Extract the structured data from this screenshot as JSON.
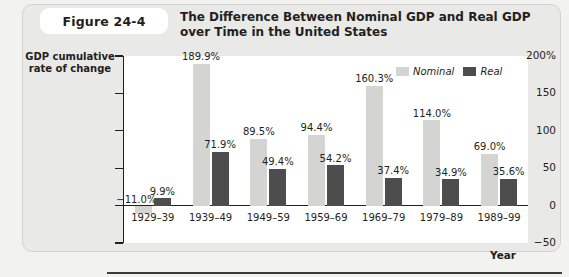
{
  "figure": {
    "badge_label": "Figure 24-4",
    "title": "The Difference Between Nominal GDP and Real GDP over Time in the United States"
  },
  "axes": {
    "y_title_line1": "GDP cumulative",
    "y_title_line2": "rate of change",
    "x_title": "Year",
    "y_ticks": [
      "200%",
      "150",
      "100",
      "50",
      "0",
      "−50"
    ]
  },
  "legend": {
    "items": [
      {
        "label": "Nominal",
        "color": "#d4d4d2"
      },
      {
        "label": "Real",
        "color": "#4d4d4d"
      }
    ]
  },
  "chart_data": {
    "type": "bar",
    "title": "The Difference Between Nominal GDP and Real GDP over Time in the United States",
    "xlabel": "Year",
    "ylabel": "GDP cumulative rate of change",
    "ylim": [
      -50,
      200
    ],
    "yticks": [
      -50,
      0,
      50,
      100,
      150,
      200
    ],
    "ytick_labels": [
      "−50",
      "0",
      "50",
      "100",
      "150",
      "200%"
    ],
    "grid": false,
    "legend_position": "top-right",
    "categories": [
      "1929–39",
      "1939–49",
      "1949–59",
      "1959–69",
      "1969–79",
      "1979–89",
      "1989–99"
    ],
    "series": [
      {
        "name": "Nominal",
        "color": "#d4d4d2",
        "values": [
          -11.0,
          189.9,
          89.5,
          94.4,
          160.3,
          114.0,
          69.0
        ],
        "labels": [
          "−11.0%",
          "189.9%",
          "89.5%",
          "94.4%",
          "160.3%",
          "114.0%",
          "69.0%"
        ]
      },
      {
        "name": "Real",
        "color": "#4d4d4d",
        "values": [
          9.9,
          71.9,
          49.4,
          54.2,
          37.4,
          34.9,
          35.6
        ],
        "labels": [
          "9.9%",
          "71.9%",
          "49.4%",
          "54.2%",
          "37.4%",
          "34.9%",
          "35.6%"
        ]
      }
    ]
  }
}
